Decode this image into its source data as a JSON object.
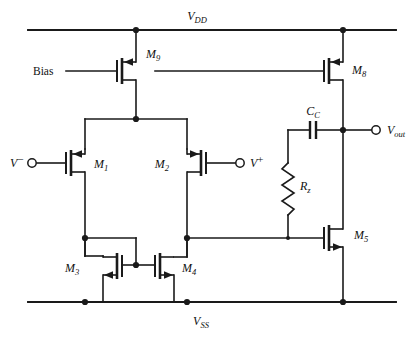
{
  "diagram": {
    "type": "circuit-schematic",
    "line_color": "#1a1a1a",
    "background_color": "#ffffff"
  },
  "rails": {
    "vdd": {
      "name": "VDD",
      "base": "V",
      "subscript": "DD"
    },
    "vss": {
      "name": "VSS",
      "base": "V",
      "subscript": "SS"
    }
  },
  "ports": {
    "bias": {
      "label": "Bias"
    },
    "vminus": {
      "base": "V",
      "superscript": "−"
    },
    "vplus": {
      "base": "V",
      "superscript": "+"
    },
    "vout": {
      "base": "V",
      "subscript": "out"
    }
  },
  "transistors": [
    {
      "id": "M1",
      "base": "M",
      "subscript": "1",
      "type": "PMOS",
      "role": "input-differential-pair-left"
    },
    {
      "id": "M2",
      "base": "M",
      "subscript": "2",
      "type": "PMOS",
      "role": "input-differential-pair-right"
    },
    {
      "id": "M3",
      "base": "M",
      "subscript": "3",
      "type": "NMOS",
      "role": "current-mirror-load-left"
    },
    {
      "id": "M4",
      "base": "M",
      "subscript": "4",
      "type": "NMOS",
      "role": "current-mirror-load-right"
    },
    {
      "id": "M5",
      "base": "M",
      "subscript": "5",
      "type": "NMOS",
      "role": "second-stage-driver"
    },
    {
      "id": "M8",
      "base": "M",
      "subscript": "8",
      "type": "PMOS",
      "role": "second-stage-current-source"
    },
    {
      "id": "M9",
      "base": "M",
      "subscript": "9",
      "type": "PMOS",
      "role": "tail-current-source"
    }
  ],
  "passives": [
    {
      "id": "CC",
      "base": "C",
      "subscript": "C",
      "type": "capacitor",
      "role": "miller-compensation"
    },
    {
      "id": "Rz",
      "base": "R",
      "subscript": "z",
      "type": "resistor",
      "role": "nulling-resistor"
    }
  ]
}
